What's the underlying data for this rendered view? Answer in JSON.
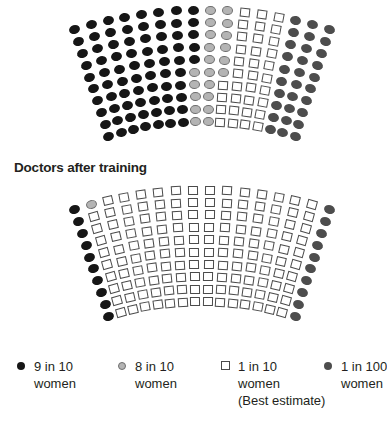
{
  "colors": {
    "nine_in_ten": "#161616",
    "eight_in_ten": "#b4b4b4",
    "one_in_ten": "#ffffff",
    "one_in_hundred": "#4d4d4d"
  },
  "section_title": "Doctors after training",
  "legend": [
    {
      "key": "black",
      "marker": "dot",
      "line1": "9 in 10",
      "line2": "women",
      "line3": ""
    },
    {
      "key": "gray",
      "marker": "dot",
      "line1": "8 in 10",
      "line2": "women",
      "line3": ""
    },
    {
      "key": "sq",
      "marker": "square",
      "line1": "1 in 10",
      "line2": "women",
      "line3": "(Best estimate)"
    },
    {
      "key": "dark",
      "marker": "dot",
      "line1": "1 in 100",
      "line2": "women",
      "line3": ""
    }
  ],
  "chart_data": [
    {
      "type": "icon-array",
      "title": "",
      "description": "Fan-shaped icon array, 16 columns x 10 rows; each symbol is a doctor's answer category (before training)",
      "columns": 16,
      "rows": [
        [
          "black",
          "black",
          "black",
          "black",
          "black",
          "black",
          "black",
          "black",
          "gray",
          "gray",
          "sq",
          "sq",
          "sq",
          "dark",
          "dark",
          "dark"
        ],
        [
          "black",
          "black",
          "black",
          "black",
          "black",
          "black",
          "black",
          "black",
          "gray",
          "gray",
          "sq",
          "sq",
          "sq",
          "dark",
          "dark",
          "dark"
        ],
        [
          "black",
          "black",
          "black",
          "black",
          "black",
          "black",
          "black",
          "black",
          "gray",
          "gray",
          "sq",
          "sq",
          "sq",
          "dark",
          "dark",
          "dark"
        ],
        [
          "black",
          "black",
          "black",
          "black",
          "black",
          "black",
          "black",
          "black",
          "gray",
          "gray",
          "sq",
          "sq",
          "sq",
          "dark",
          "dark",
          "dark"
        ],
        [
          "black",
          "black",
          "black",
          "black",
          "black",
          "black",
          "black",
          "black",
          "gray",
          "gray",
          "sq",
          "sq",
          "sq",
          "dark",
          "dark",
          "dark"
        ],
        [
          "black",
          "black",
          "black",
          "black",
          "black",
          "black",
          "black",
          "gray",
          "gray",
          "gray",
          "sq",
          "sq",
          "sq",
          "dark",
          "dark",
          "dark"
        ],
        [
          "black",
          "black",
          "black",
          "black",
          "black",
          "black",
          "black",
          "gray",
          "gray",
          "sq",
          "sq",
          "sq",
          "sq",
          "dark",
          "dark",
          "dark"
        ],
        [
          "black",
          "black",
          "black",
          "black",
          "black",
          "black",
          "black",
          "gray",
          "gray",
          "sq",
          "sq",
          "sq",
          "sq",
          "dark",
          "dark",
          "dark"
        ],
        [
          "black",
          "black",
          "black",
          "black",
          "black",
          "black",
          "black",
          "gray",
          "gray",
          "sq",
          "sq",
          "sq",
          "sq",
          "dark",
          "dark",
          "dark"
        ],
        [
          "black",
          "black",
          "black",
          "black",
          "black",
          "black",
          "black",
          "gray",
          "gray",
          "sq",
          "sq",
          "sq",
          "sq",
          "dark",
          "dark",
          "dark"
        ]
      ],
      "counts": {
        "9 in 10 women": 75,
        "8 in 10 women": 26,
        "1 in 10 women (Best estimate)": 29,
        "1 in 100 women": 30
      }
    },
    {
      "type": "icon-array",
      "title": "Doctors after training",
      "columns": 16,
      "rows": [
        [
          "black",
          "gray",
          "sq",
          "sq",
          "sq",
          "sq",
          "sq",
          "sq",
          "sq",
          "sq",
          "sq",
          "sq",
          "sq",
          "sq",
          "sq",
          "dark"
        ],
        [
          "black",
          "sq",
          "sq",
          "sq",
          "sq",
          "sq",
          "sq",
          "sq",
          "sq",
          "sq",
          "sq",
          "sq",
          "sq",
          "sq",
          "sq",
          "dark"
        ],
        [
          "black",
          "sq",
          "sq",
          "sq",
          "sq",
          "sq",
          "sq",
          "sq",
          "sq",
          "sq",
          "sq",
          "sq",
          "sq",
          "sq",
          "sq",
          "dark"
        ],
        [
          "black",
          "sq",
          "sq",
          "sq",
          "sq",
          "sq",
          "sq",
          "sq",
          "sq",
          "sq",
          "sq",
          "sq",
          "sq",
          "sq",
          "sq",
          "dark"
        ],
        [
          "black",
          "sq",
          "sq",
          "sq",
          "sq",
          "sq",
          "sq",
          "sq",
          "sq",
          "sq",
          "sq",
          "sq",
          "sq",
          "sq",
          "sq",
          "dark"
        ],
        [
          "black",
          "sq",
          "sq",
          "sq",
          "sq",
          "sq",
          "sq",
          "sq",
          "sq",
          "sq",
          "sq",
          "sq",
          "sq",
          "sq",
          "sq",
          "dark"
        ],
        [
          "black",
          "sq",
          "sq",
          "sq",
          "sq",
          "sq",
          "sq",
          "sq",
          "sq",
          "sq",
          "sq",
          "sq",
          "sq",
          "sq",
          "sq",
          "dark"
        ],
        [
          "black",
          "sq",
          "sq",
          "sq",
          "sq",
          "sq",
          "sq",
          "sq",
          "sq",
          "sq",
          "sq",
          "sq",
          "sq",
          "sq",
          "sq",
          "dark"
        ],
        [
          "black",
          "sq",
          "sq",
          "sq",
          "sq",
          "sq",
          "sq",
          "sq",
          "sq",
          "sq",
          "sq",
          "sq",
          "sq",
          "sq",
          "sq",
          "dark"
        ],
        [
          "black",
          "sq",
          "sq",
          "sq",
          "sq",
          "sq",
          "sq",
          "sq",
          "sq",
          "sq",
          "sq",
          "sq",
          "sq",
          "sq",
          "sq",
          "dark"
        ]
      ],
      "counts": {
        "9 in 10 women": 10,
        "8 in 10 women": 1,
        "1 in 10 women (Best estimate)": 139,
        "1 in 100 women": 10
      }
    }
  ]
}
